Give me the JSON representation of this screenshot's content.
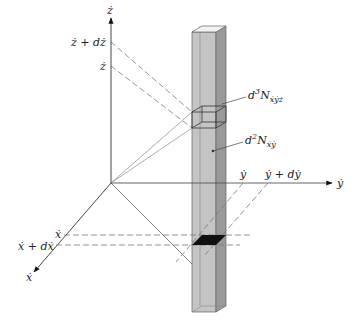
{
  "diagram": {
    "axes": {
      "z": {
        "label": "ż"
      },
      "y": {
        "label": "ẏ"
      },
      "x": {
        "label": "ẋ"
      }
    },
    "tick_labels": {
      "z_upper": "ż + dż",
      "z_lower": "ż",
      "y_lower": "ẏ",
      "y_upper": "ẏ + dẏ",
      "x_lower": "ẋ",
      "x_upper": "ẋ + dẋ"
    },
    "annotations": {
      "volume_element": {
        "prefix": "d",
        "power": "3",
        "symbol": "N",
        "subscript": "ẋẏż"
      },
      "column_element": {
        "prefix": "d",
        "power": "2",
        "symbol": "N",
        "subscript": "ẋẏ"
      }
    },
    "colors": {
      "column_front": "#c4c4c4",
      "column_side": "#9a9a9a",
      "column_top": "#f2f2f2",
      "base_cell": "#111111",
      "line": "#555555",
      "dash": "#777777"
    }
  }
}
